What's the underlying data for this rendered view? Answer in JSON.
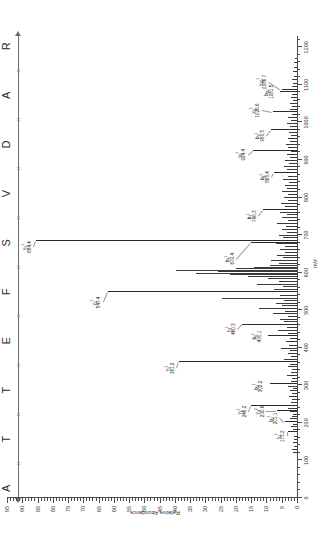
{
  "chart_data": {
    "type": "bar",
    "title": "",
    "subtitle": "",
    "xlabel": "m/z",
    "ylabel": "Relative Abundance",
    "xlim": [
      0,
      1230
    ],
    "ylim": [
      0,
      95
    ],
    "grid": false,
    "legend": null,
    "orientation": "rotated-90-ccw",
    "x_ticks": [
      0,
      100,
      200,
      300,
      400,
      500,
      600,
      700,
      800,
      900,
      1000,
      1100,
      1200
    ],
    "y_ticks": [
      0,
      5,
      10,
      15,
      20,
      25,
      30,
      35,
      40,
      45,
      50,
      55,
      60,
      65,
      70,
      75,
      80,
      85,
      90,
      95
    ],
    "peptide_sequence": [
      "A",
      "T",
      "T",
      "E",
      "F",
      "S",
      "V",
      "D",
      "A",
      "R"
    ],
    "labeled_peaks": [
      {
        "ion": "y",
        "index": "1",
        "charge": "1",
        "mz": 175.2,
        "abundance": 3.0,
        "label_mass": "175.2"
      },
      {
        "ion": "b",
        "index": "2",
        "charge": "1",
        "mz": 201.1,
        "abundance": 4.0,
        "label_mass": "201.1"
      },
      {
        "ion": "y",
        "index": "4",
        "charge": "2",
        "mz": 230.6,
        "abundance": 6.5,
        "label_mass": "230.6"
      },
      {
        "ion": "y",
        "index": "2",
        "charge": "1",
        "mz": 246.2,
        "abundance": 15.0,
        "label_mass": "246.2"
      },
      {
        "ion": "b",
        "index": "3",
        "charge": "1",
        "mz": 302.2,
        "abundance": 9.0,
        "label_mass": "302.2"
      },
      {
        "ion": "y",
        "index": "3",
        "charge": "1",
        "mz": 361.2,
        "abundance": 38.5,
        "label_mass": "361.2"
      },
      {
        "ion": "b",
        "index": "4",
        "charge": "1",
        "mz": 430.1,
        "abundance": 9.5,
        "label_mass": "430.1"
      },
      {
        "ion": "y",
        "index": "4",
        "charge": "1",
        "mz": 460.3,
        "abundance": 18.0,
        "label_mass": "460.3"
      },
      {
        "ion": "y",
        "index": "5",
        "charge": "1",
        "mz": 547.4,
        "abundance": 62.0,
        "label_mass": "547.4"
      },
      {
        "ion": "b",
        "index": "6",
        "charge": "1",
        "mz": 679.4,
        "abundance": 15.0,
        "label_mass": "679.4"
      },
      {
        "ion": "y",
        "index": "6",
        "charge": "1",
        "mz": 684.4,
        "abundance": 85.5,
        "label_mass": "684.4"
      },
      {
        "ion": "b",
        "index": "7",
        "charge": "1",
        "mz": 766.3,
        "abundance": 11.0,
        "label_mass": "766.3"
      },
      {
        "ion": "b",
        "index": "8",
        "charge": "1",
        "mz": 865.4,
        "abundance": 7.5,
        "label_mass": "865.4"
      },
      {
        "ion": "y",
        "index": "8",
        "charge": "1",
        "mz": 924.4,
        "abundance": 14.5,
        "label_mass": "924.4"
      },
      {
        "ion": "b",
        "index": "9",
        "charge": "1",
        "mz": 980.5,
        "abundance": 8.5,
        "label_mass": "980.5"
      },
      {
        "ion": "y",
        "index": "9",
        "charge": "1",
        "mz": 1026.6,
        "abundance": 8.0,
        "label_mass": "1026.6"
      },
      {
        "ion": "b",
        "index": "10",
        "charge": "1",
        "mz": 1081.5,
        "abundance": 5.5,
        "label_mass": "1081.5"
      },
      {
        "ion": "y",
        "index": "10",
        "charge": "1",
        "mz": 1086.7,
        "abundance": 5.0,
        "label_mass": "1086.7"
      }
    ],
    "unlabeled_peaks": [
      {
        "mz": 120.0,
        "abundance": 1.2
      },
      {
        "mz": 129.0,
        "abundance": 1.6
      },
      {
        "mz": 136.0,
        "abundance": 1.0
      },
      {
        "mz": 147.0,
        "abundance": 1.4
      },
      {
        "mz": 155.0,
        "abundance": 0.9
      },
      {
        "mz": 163.0,
        "abundance": 1.1
      },
      {
        "mz": 181.0,
        "abundance": 1.3
      },
      {
        "mz": 189.0,
        "abundance": 2.0
      },
      {
        "mz": 195.0,
        "abundance": 1.2
      },
      {
        "mz": 209.0,
        "abundance": 2.4
      },
      {
        "mz": 216.0,
        "abundance": 1.7
      },
      {
        "mz": 222.0,
        "abundance": 1.3
      },
      {
        "mz": 228.0,
        "abundance": 2.2
      },
      {
        "mz": 237.0,
        "abundance": 2.8
      },
      {
        "mz": 253.0,
        "abundance": 2.0
      },
      {
        "mz": 261.0,
        "abundance": 1.5
      },
      {
        "mz": 269.0,
        "abundance": 2.6
      },
      {
        "mz": 276.0,
        "abundance": 1.8
      },
      {
        "mz": 284.0,
        "abundance": 2.2
      },
      {
        "mz": 291.0,
        "abundance": 1.4
      },
      {
        "mz": 296.0,
        "abundance": 3.0
      },
      {
        "mz": 310.0,
        "abundance": 2.1
      },
      {
        "mz": 317.0,
        "abundance": 1.6
      },
      {
        "mz": 325.0,
        "abundance": 3.4
      },
      {
        "mz": 333.0,
        "abundance": 2.0
      },
      {
        "mz": 341.0,
        "abundance": 1.5
      },
      {
        "mz": 349.0,
        "abundance": 2.8
      },
      {
        "mz": 355.0,
        "abundance": 2.2
      },
      {
        "mz": 368.0,
        "abundance": 4.4
      },
      {
        "mz": 375.0,
        "abundance": 2.0
      },
      {
        "mz": 383.0,
        "abundance": 3.1
      },
      {
        "mz": 391.0,
        "abundance": 2.3
      },
      {
        "mz": 398.0,
        "abundance": 5.2
      },
      {
        "mz": 406.0,
        "abundance": 2.6
      },
      {
        "mz": 414.0,
        "abundance": 3.6
      },
      {
        "mz": 422.0,
        "abundance": 2.2
      },
      {
        "mz": 437.0,
        "abundance": 3.0
      },
      {
        "mz": 444.0,
        "abundance": 6.2
      },
      {
        "mz": 452.0,
        "abundance": 3.4
      },
      {
        "mz": 468.0,
        "abundance": 4.2
      },
      {
        "mz": 475.0,
        "abundance": 5.6
      },
      {
        "mz": 482.0,
        "abundance": 3.0
      },
      {
        "mz": 489.0,
        "abundance": 8.0
      },
      {
        "mz": 496.0,
        "abundance": 4.0
      },
      {
        "mz": 503.0,
        "abundance": 12.5
      },
      {
        "mz": 510.0,
        "abundance": 5.0
      },
      {
        "mz": 517.0,
        "abundance": 6.8
      },
      {
        "mz": 524.0,
        "abundance": 4.2
      },
      {
        "mz": 531.0,
        "abundance": 24.5
      },
      {
        "mz": 538.0,
        "abundance": 5.5
      },
      {
        "mz": 554.0,
        "abundance": 7.5
      },
      {
        "mz": 561.0,
        "abundance": 4.5
      },
      {
        "mz": 568.0,
        "abundance": 13.0
      },
      {
        "mz": 575.0,
        "abundance": 6.0
      },
      {
        "mz": 582.0,
        "abundance": 9.5
      },
      {
        "mz": 588.0,
        "abundance": 16.0
      },
      {
        "mz": 593.0,
        "abundance": 22.0
      },
      {
        "mz": 597.0,
        "abundance": 33.0
      },
      {
        "mz": 601.0,
        "abundance": 26.0
      },
      {
        "mz": 605.0,
        "abundance": 39.5
      },
      {
        "mz": 609.0,
        "abundance": 20.0
      },
      {
        "mz": 613.0,
        "abundance": 14.0
      },
      {
        "mz": 618.0,
        "abundance": 9.0
      },
      {
        "mz": 624.0,
        "abundance": 6.0
      },
      {
        "mz": 631.0,
        "abundance": 8.5
      },
      {
        "mz": 638.0,
        "abundance": 4.5
      },
      {
        "mz": 645.0,
        "abundance": 6.5
      },
      {
        "mz": 652.0,
        "abundance": 3.8
      },
      {
        "mz": 660.0,
        "abundance": 5.5
      },
      {
        "mz": 668.0,
        "abundance": 4.0
      },
      {
        "mz": 675.0,
        "abundance": 7.0
      },
      {
        "mz": 691.0,
        "abundance": 4.5
      },
      {
        "mz": 698.0,
        "abundance": 6.0
      },
      {
        "mz": 706.0,
        "abundance": 3.2
      },
      {
        "mz": 714.0,
        "abundance": 5.0
      },
      {
        "mz": 722.0,
        "abundance": 3.6
      },
      {
        "mz": 730.0,
        "abundance": 6.5
      },
      {
        "mz": 738.0,
        "abundance": 3.0
      },
      {
        "mz": 746.0,
        "abundance": 4.8
      },
      {
        "mz": 754.0,
        "abundance": 3.4
      },
      {
        "mz": 760.0,
        "abundance": 5.6
      },
      {
        "mz": 774.0,
        "abundance": 4.0
      },
      {
        "mz": 782.0,
        "abundance": 5.2
      },
      {
        "mz": 790.0,
        "abundance": 3.0
      },
      {
        "mz": 798.0,
        "abundance": 4.4
      },
      {
        "mz": 806.0,
        "abundance": 2.8
      },
      {
        "mz": 814.0,
        "abundance": 5.0
      },
      {
        "mz": 822.0,
        "abundance": 3.4
      },
      {
        "mz": 830.0,
        "abundance": 4.0
      },
      {
        "mz": 838.0,
        "abundance": 2.6
      },
      {
        "mz": 846.0,
        "abundance": 4.6
      },
      {
        "mz": 855.0,
        "abundance": 3.0
      },
      {
        "mz": 872.0,
        "abundance": 3.4
      },
      {
        "mz": 880.0,
        "abundance": 4.2
      },
      {
        "mz": 888.0,
        "abundance": 2.6
      },
      {
        "mz": 896.0,
        "abundance": 3.8
      },
      {
        "mz": 904.0,
        "abundance": 2.4
      },
      {
        "mz": 912.0,
        "abundance": 3.2
      },
      {
        "mz": 920.0,
        "abundance": 2.0
      },
      {
        "mz": 932.0,
        "abundance": 2.8
      },
      {
        "mz": 940.0,
        "abundance": 3.6
      },
      {
        "mz": 948.0,
        "abundance": 2.2
      },
      {
        "mz": 956.0,
        "abundance": 3.0
      },
      {
        "mz": 964.0,
        "abundance": 2.0
      },
      {
        "mz": 972.0,
        "abundance": 2.6
      },
      {
        "mz": 988.0,
        "abundance": 2.2
      },
      {
        "mz": 996.0,
        "abundance": 3.4
      },
      {
        "mz": 1004.0,
        "abundance": 2.0
      },
      {
        "mz": 1012.0,
        "abundance": 2.8
      },
      {
        "mz": 1020.0,
        "abundance": 1.8
      },
      {
        "mz": 1034.0,
        "abundance": 2.4
      },
      {
        "mz": 1042.0,
        "abundance": 1.6
      },
      {
        "mz": 1050.0,
        "abundance": 2.2
      },
      {
        "mz": 1058.0,
        "abundance": 1.4
      },
      {
        "mz": 1066.0,
        "abundance": 2.0
      },
      {
        "mz": 1074.0,
        "abundance": 1.5
      },
      {
        "mz": 1094.0,
        "abundance": 1.8
      },
      {
        "mz": 1102.0,
        "abundance": 1.2
      },
      {
        "mz": 1112.0,
        "abundance": 1.6
      },
      {
        "mz": 1122.0,
        "abundance": 1.0
      },
      {
        "mz": 1134.0,
        "abundance": 1.3
      },
      {
        "mz": 1146.0,
        "abundance": 0.9
      },
      {
        "mz": 1158.0,
        "abundance": 1.1
      },
      {
        "mz": 1170.0,
        "abundance": 0.8
      }
    ]
  }
}
